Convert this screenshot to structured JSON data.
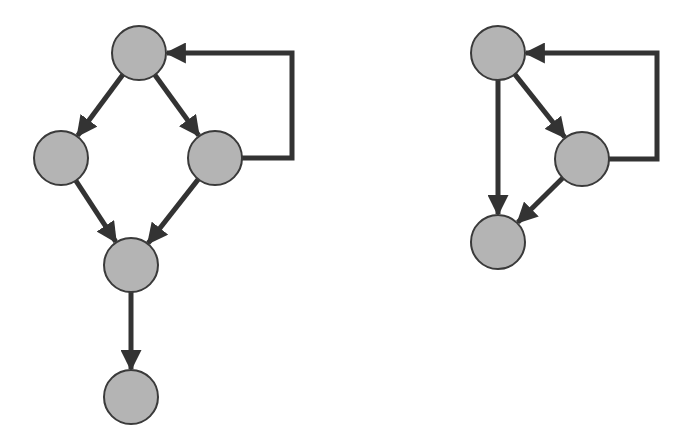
{
  "diagram": {
    "style": {
      "node_fill": "#b4b4b4",
      "node_stroke": "#3a3a3a",
      "edge_color": "#333333",
      "node_radius": 27
    },
    "graphs": [
      {
        "name": "left-graph",
        "nodes": [
          {
            "id": "a",
            "x": 139,
            "y": 53
          },
          {
            "id": "b",
            "x": 61,
            "y": 158
          },
          {
            "id": "c",
            "x": 215,
            "y": 158
          },
          {
            "id": "d",
            "x": 131,
            "y": 265
          },
          {
            "id": "e",
            "x": 131,
            "y": 397
          }
        ],
        "edges": [
          {
            "from": "a",
            "to": "b"
          },
          {
            "from": "a",
            "to": "c"
          },
          {
            "from": "b",
            "to": "d"
          },
          {
            "from": "c",
            "to": "d"
          },
          {
            "from": "d",
            "to": "e"
          },
          {
            "from": "c",
            "to": "a",
            "type": "loop-back",
            "route_x": 292
          }
        ]
      },
      {
        "name": "right-graph",
        "nodes": [
          {
            "id": "f",
            "x": 498,
            "y": 53
          },
          {
            "id": "g",
            "x": 582,
            "y": 159
          },
          {
            "id": "h",
            "x": 498,
            "y": 242
          }
        ],
        "edges": [
          {
            "from": "f",
            "to": "h"
          },
          {
            "from": "f",
            "to": "g"
          },
          {
            "from": "g",
            "to": "h"
          },
          {
            "from": "g",
            "to": "f",
            "type": "loop-back",
            "route_x": 657
          }
        ]
      }
    ]
  }
}
